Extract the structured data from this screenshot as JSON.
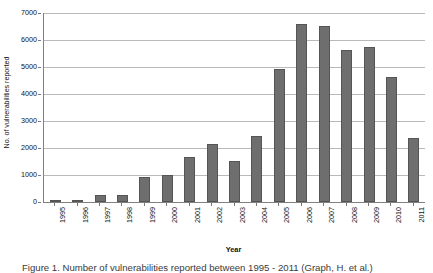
{
  "chart_data": {
    "type": "bar",
    "title": "",
    "xlabel": "Year",
    "ylabel": "No. of vulnerabilities reported",
    "categories": [
      "1995",
      "1996",
      "1997",
      "1998",
      "1999",
      "2000",
      "2001",
      "2002",
      "2003",
      "2004",
      "2005",
      "2006",
      "2007",
      "2008",
      "2009",
      "2010",
      "2011"
    ],
    "values": [
      25,
      75,
      250,
      245,
      920,
      1020,
      1680,
      2160,
      1530,
      2450,
      4930,
      6610,
      6520,
      5630,
      5730,
      4650,
      2360
    ],
    "ylim": [
      0,
      7000
    ],
    "ytick_labels": [
      "0",
      "1000",
      "2000",
      "3000",
      "4000",
      "5000",
      "6000",
      "7000"
    ],
    "ytick_values": [
      0,
      1000,
      2000,
      3000,
      4000,
      5000,
      6000,
      7000
    ],
    "grid": true,
    "legend": "none",
    "bar_color": "#6e6e6e",
    "bar_border_color": "#555555",
    "gridline_color": "#b9b9b9",
    "axis_color": "#808080"
  },
  "caption": {
    "text": "Figure 1. Number of vulnerabilities reported between 1995 - 2011 (Graph, H. et al.)"
  }
}
